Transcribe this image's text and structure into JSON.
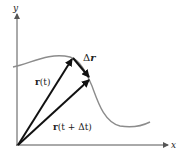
{
  "diagram": {
    "type": "vector-position-curve",
    "axes": {
      "x_label": "x",
      "y_label": "y"
    },
    "vectors": [
      {
        "name": "r(t)",
        "label_bold": "r",
        "label_rest": "(t)"
      },
      {
        "name": "r(t + Δt)",
        "label_bold": "r",
        "label_rest": "(t + Δt)"
      },
      {
        "name": "Δr",
        "label_prefix": "Δ",
        "label_bold": "r"
      }
    ],
    "colors": {
      "curve": "#8c8c8c",
      "vectors": "#111111",
      "axes": "#555555"
    }
  }
}
